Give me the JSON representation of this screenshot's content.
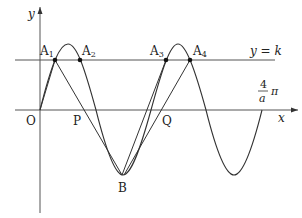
{
  "labels": {
    "y_axis": "y",
    "x_axis": "x",
    "origin": "O",
    "P": "P",
    "Q": "Q",
    "B": "B",
    "A1": "A",
    "A1_sub": "1",
    "A2": "A",
    "A2_sub": "2",
    "A3": "A",
    "A3_sub": "3",
    "A4": "A",
    "A4_sub": "4",
    "line_k": "y = k",
    "frac_num": "4",
    "frac_den": "a",
    "pi": "π"
  },
  "colors": {
    "stroke": "#333333",
    "axis": "#555555"
  }
}
